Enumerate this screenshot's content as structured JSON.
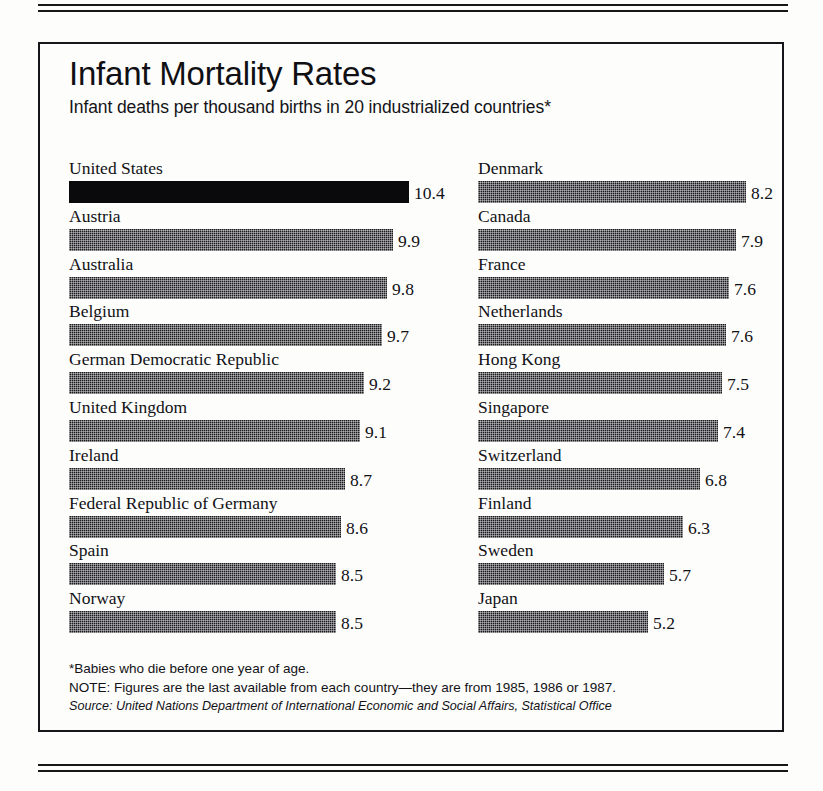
{
  "chart_data": {
    "type": "bar",
    "title": "Infant Mortality Rates",
    "subtitle": "Infant deaths per thousand births in 20 industrialized countries*",
    "xlabel": "",
    "ylabel": "Infant deaths per thousand births",
    "orientation": "horizontal",
    "grid": false,
    "legend": "none",
    "xlim": [
      0,
      10.4
    ],
    "categories": [
      "United States",
      "Austria",
      "Australia",
      "Belgium",
      "German Democratic Republic",
      "United Kingdom",
      "Ireland",
      "Federal Republic of Germany",
      "Spain",
      "Norway",
      "Denmark",
      "Canada",
      "France",
      "Netherlands",
      "Hong Kong",
      "Singapore",
      "Switzerland",
      "Finland",
      "Sweden",
      "Japan"
    ],
    "values": [
      10.4,
      9.9,
      9.8,
      9.7,
      9.2,
      9.1,
      8.7,
      8.6,
      8.5,
      8.5,
      8.2,
      7.9,
      7.6,
      7.6,
      7.5,
      7.4,
      6.8,
      6.3,
      5.7,
      5.2
    ],
    "annotations": [
      "*Babies who die before one year of age.",
      "NOTE: Figures are the last available from each country—they are from 1985, 1986 or 1987.",
      "Source: United Nations Department of International Economic and Social Affairs, Statistical Office"
    ]
  },
  "header": {
    "title": "Infant Mortality Rates",
    "subtitle": "Infant deaths per thousand births in 20 industrialized countries*"
  },
  "columns": {
    "left": [
      {
        "label": "United States",
        "value": "10.4",
        "bar_px": 340,
        "highlight": true
      },
      {
        "label": "Austria",
        "value": "9.9",
        "bar_px": 324,
        "highlight": false
      },
      {
        "label": "Australia",
        "value": "9.8",
        "bar_px": 318,
        "highlight": false
      },
      {
        "label": "Belgium",
        "value": "9.7",
        "bar_px": 313,
        "highlight": false
      },
      {
        "label": "German Democratic Republic",
        "value": "9.2",
        "bar_px": 295,
        "highlight": false
      },
      {
        "label": "United Kingdom",
        "value": "9.1",
        "bar_px": 291,
        "highlight": false
      },
      {
        "label": "Ireland",
        "value": "8.7",
        "bar_px": 276,
        "highlight": false
      },
      {
        "label": "Federal Republic of Germany",
        "value": "8.6",
        "bar_px": 272,
        "highlight": false
      },
      {
        "label": "Spain",
        "value": "8.5",
        "bar_px": 267,
        "highlight": false
      },
      {
        "label": "Norway",
        "value": "8.5",
        "bar_px": 267,
        "highlight": false
      }
    ],
    "right": [
      {
        "label": "Denmark",
        "value": "8.2",
        "bar_px": 268,
        "highlight": false
      },
      {
        "label": "Canada",
        "value": "7.9",
        "bar_px": 258,
        "highlight": false
      },
      {
        "label": "France",
        "value": "7.6",
        "bar_px": 251,
        "highlight": false
      },
      {
        "label": "Netherlands",
        "value": "7.6",
        "bar_px": 248,
        "highlight": false
      },
      {
        "label": "Hong Kong",
        "value": "7.5",
        "bar_px": 244,
        "highlight": false
      },
      {
        "label": "Singapore",
        "value": "7.4",
        "bar_px": 240,
        "highlight": false
      },
      {
        "label": "Switzerland",
        "value": "6.8",
        "bar_px": 222,
        "highlight": false
      },
      {
        "label": "Finland",
        "value": "6.3",
        "bar_px": 205,
        "highlight": false
      },
      {
        "label": "Sweden",
        "value": "5.7",
        "bar_px": 186,
        "highlight": false
      },
      {
        "label": "Japan",
        "value": "5.2",
        "bar_px": 170,
        "highlight": false
      }
    ]
  },
  "footnotes": {
    "asterisk": "*Babies who die before one year of age.",
    "note": "NOTE: Figures are the last available from each country—they are from 1985, 1986 or 1987.",
    "source": "Source: United Nations Department of International Economic and Social Affairs, Statistical Office"
  },
  "colors": {
    "ink": "#15151a",
    "bar_fill": "#1b1b1f",
    "bar_highlight": "#0a0a0c",
    "paper": "#fdfdfb"
  }
}
